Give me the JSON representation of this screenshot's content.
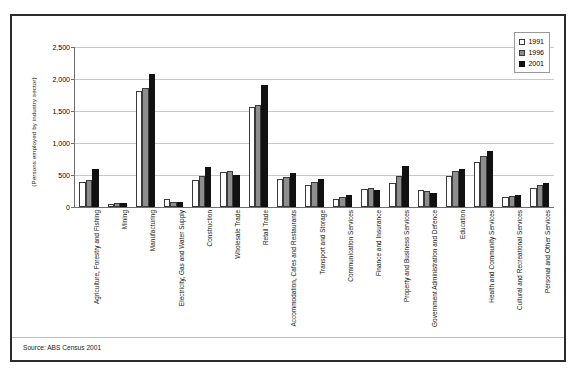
{
  "figure": {
    "source_note": "Source: ABS Census 2001",
    "y_axis_title": "(Persons employed by industry sector)"
  },
  "legend": {
    "position": "top-right",
    "entries": [
      {
        "label": "1991",
        "swatch": "open-square-icon",
        "color": "#ffffff"
      },
      {
        "label": "1996",
        "swatch": "gray-square-icon",
        "color": "#8e8e8e"
      },
      {
        "label": "2001",
        "swatch": "filled-square-icon",
        "color": "#111111"
      }
    ]
  },
  "y_axis": {
    "ticks": [
      "0",
      "500",
      "1,000",
      "1,500",
      "2,000",
      "2,500"
    ]
  },
  "chart_data": {
    "type": "bar",
    "title": "",
    "subtitle": "",
    "xlabel": "",
    "ylabel": "(Persons employed by industry sector)",
    "ylim": [
      0,
      2500
    ],
    "ytick_step": 500,
    "grid": true,
    "legend_position": "top-right",
    "categories": [
      "Agriculture, Forestry and Fishing",
      "Mining",
      "Manufacturing",
      "Electricity, Gas and Water Supply",
      "Construction",
      "Wholesale Trade",
      "Retail Trade",
      "Accommodation, Cafes and Restaurants",
      "Transport and Storage",
      "Communication Services",
      "Finance and Insurance",
      "Property and Business Services",
      "Government Administration and Defence",
      "Education",
      "Health and Community Services",
      "Cultural and Recreational Services",
      "Personal and Other Services"
    ],
    "series": [
      {
        "name": "1991",
        "values": [
          390,
          50,
          1815,
          120,
          425,
          550,
          1565,
          430,
          350,
          120,
          280,
          370,
          270,
          485,
          700,
          150,
          290
        ]
      },
      {
        "name": "1996",
        "values": [
          420,
          60,
          1865,
          80,
          480,
          570,
          1590,
          470,
          390,
          150,
          295,
          490,
          255,
          555,
          800,
          170,
          340
        ]
      },
      {
        "name": "2001",
        "values": [
          590,
          55,
          2080,
          80,
          625,
          505,
          1900,
          530,
          440,
          185,
          265,
          635,
          215,
          600,
          880,
          185,
          370
        ]
      }
    ]
  },
  "cropped_text": {
    "top": "",
    "bottom": ""
  }
}
